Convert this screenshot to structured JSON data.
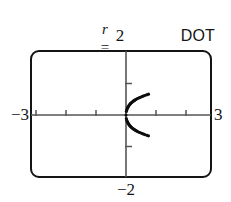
{
  "figure": {
    "title_parts": {
      "lhs": "r",
      "equals": "=",
      "term1_fn": "sin",
      "term1_var": "θ",
      "term2_fn": "tan",
      "term2_var": "θ"
    },
    "title_plain": "r = sin θ tan θ",
    "mode_label": "DOT",
    "labels": {
      "x_min": "−3",
      "x_max": "3",
      "y_max": "2",
      "y_min": "−2"
    },
    "colors": {
      "frame": "#141414",
      "axis": "#555555",
      "curve": "#0d0d0d",
      "text": "#141414",
      "background": "#ffffff"
    }
  },
  "chart_data": {
    "type": "scatter",
    "title": "r = sin θ tan θ",
    "equation": "r = sin(θ) tan(θ)",
    "plot_style": "dot",
    "xlabel": "",
    "ylabel": "",
    "xlim": [
      -3,
      3
    ],
    "ylim": [
      -2,
      2
    ],
    "xticks": [
      -3,
      -2,
      -1,
      0,
      1,
      2,
      3
    ],
    "yticks": [
      -2,
      -1,
      0,
      1,
      2
    ],
    "grid": false,
    "legend": false,
    "axes_style": "calculator-viewport",
    "x_tick_interval": 1,
    "y_tick_interval": 1,
    "points": [
      [
        0.0,
        0.0
      ],
      [
        0.0123,
        0.1109
      ],
      [
        0.0247,
        0.1566
      ],
      [
        0.0373,
        0.1916
      ],
      [
        0.0503,
        0.2212
      ],
      [
        0.0637,
        0.2473
      ],
      [
        0.0776,
        0.271
      ],
      [
        0.0921,
        0.293
      ],
      [
        0.1072,
        0.3136
      ],
      [
        0.1232,
        0.3333
      ],
      [
        0.14,
        0.3521
      ],
      [
        0.1578,
        0.3703
      ],
      [
        0.1767,
        0.388
      ],
      [
        0.1968,
        0.4053
      ],
      [
        0.2182,
        0.4223
      ],
      [
        0.2412,
        0.4391
      ],
      [
        0.2658,
        0.4557
      ],
      [
        0.2922,
        0.4722
      ],
      [
        0.3205,
        0.4887
      ],
      [
        0.3511,
        0.5052
      ],
      [
        0.384,
        0.5218
      ],
      [
        0.4195,
        0.5386
      ],
      [
        0.4578,
        0.5555
      ],
      [
        0.4992,
        0.5728
      ],
      [
        0.5439,
        0.5904
      ],
      [
        0.5923,
        0.6085
      ],
      [
        0.6446,
        0.6271
      ],
      [
        0.7013,
        0.6463
      ],
      [
        0.75,
        0.662
      ]
    ],
    "branch_symmetry": "curve is symmetric about the x-axis (points mirrored for negative y)",
    "series": [
      {
        "name": "r = sin θ tan θ (upper branch)",
        "x": [
          0.0,
          0.05,
          0.13,
          0.22,
          0.32,
          0.46,
          0.64,
          0.75
        ],
        "y": [
          0.0,
          0.22,
          0.33,
          0.42,
          0.49,
          0.56,
          0.63,
          0.66
        ]
      },
      {
        "name": "r = sin θ tan θ (lower branch)",
        "x": [
          0.0,
          0.05,
          0.13,
          0.22,
          0.32,
          0.46,
          0.64,
          0.75
        ],
        "y": [
          0.0,
          -0.22,
          -0.33,
          -0.42,
          -0.49,
          -0.56,
          -0.63,
          -0.66
        ]
      }
    ]
  }
}
